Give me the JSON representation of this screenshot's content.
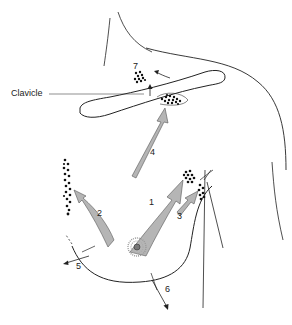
{
  "diagram": {
    "labels": {
      "clavicle": "Clavicle"
    },
    "pathways": [
      {
        "id": "1",
        "label": "1"
      },
      {
        "id": "2",
        "label": "2"
      },
      {
        "id": "3",
        "label": "3"
      },
      {
        "id": "4",
        "label": "4"
      },
      {
        "id": "5",
        "label": "5"
      },
      {
        "id": "6",
        "label": "6"
      },
      {
        "id": "7",
        "label": "7"
      }
    ],
    "colors": {
      "outline": "#222222",
      "arrow_fill": "#b5b5b5",
      "arrow_stroke": "#555555",
      "node_dots": "#111111",
      "areola": "#9a9a9a"
    }
  }
}
